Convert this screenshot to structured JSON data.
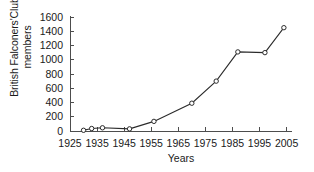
{
  "chart_data": {
    "type": "line",
    "title": "",
    "xlabel": "Years",
    "ylabel": "British Falconers'Club members",
    "ylabel_lines": [
      "British Falconers'Club",
      "members"
    ],
    "xlim": [
      1925,
      2007
    ],
    "ylim": [
      0,
      1600
    ],
    "grid": false,
    "legend": null,
    "xticks": [
      1925,
      1935,
      1945,
      1955,
      1965,
      1975,
      1985,
      1995,
      2005
    ],
    "xtick_labels": [
      "1925",
      "1935",
      "1945",
      "1955",
      "1965",
      "1975",
      "1985",
      "1995",
      "2005"
    ],
    "yticks": [
      0,
      200,
      400,
      600,
      800,
      1000,
      1200,
      1400,
      1600
    ],
    "ytick_labels": [
      "0",
      "200",
      "400",
      "600",
      "800",
      "1000",
      "1200",
      "1400",
      "1600"
    ],
    "marker": "circle-open",
    "line_color": "#2b2b2b",
    "marker_face_color": "#ffffff",
    "x": [
      1930,
      1933,
      1937,
      1947,
      1956,
      1970,
      1979,
      1987,
      1997,
      2004
    ],
    "values": [
      10,
      35,
      45,
      30,
      135,
      390,
      700,
      1110,
      1100,
      1450
    ],
    "series": [
      {
        "name": "British Falconers'Club members",
        "points": [
          {
            "x": 1930,
            "y": 10
          },
          {
            "x": 1933,
            "y": 35
          },
          {
            "x": 1937,
            "y": 45
          },
          {
            "x": 1947,
            "y": 30
          },
          {
            "x": 1956,
            "y": 135
          },
          {
            "x": 1970,
            "y": 390
          },
          {
            "x": 1979,
            "y": 700
          },
          {
            "x": 1987,
            "y": 1110
          },
          {
            "x": 1997,
            "y": 1100
          },
          {
            "x": 2004,
            "y": 1450
          }
        ]
      }
    ]
  }
}
